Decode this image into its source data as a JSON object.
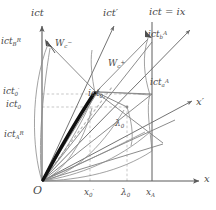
{
  "figure": {
    "kind": "minkowski-spacetime-diagram",
    "background": "#ffffff",
    "line_color": "#6b6b6b",
    "axis_color": "#5a5a5a",
    "dash_color": "#9a9a9a",
    "worldline_color": "#111111",
    "width": 216,
    "height": 210
  },
  "axes": {
    "vertical_label": "ict",
    "vertical_primed_label": "ict",
    "vertical_primed_prime": "′",
    "horizontal_label": "x",
    "horizontal_primed_label": "x",
    "horizontal_primed_prime": "′",
    "origin_label": "O",
    "lightcone_label": "ict = ix"
  },
  "tick_labels": {
    "x_axis": [
      {
        "name": "x0-prime",
        "base": "x",
        "sub": "0",
        "prime": "′",
        "x": 84,
        "y": 189
      },
      {
        "name": "lambda0",
        "base": "λ",
        "sub": "0",
        "prime": "",
        "x": 123,
        "y": 189
      },
      {
        "name": "xA",
        "base": "x",
        "sub": "A",
        "prime": "",
        "x": 149,
        "y": 189
      }
    ],
    "t_axis": [
      {
        "name": "ict0-prime",
        "base": "ict",
        "sub": "0",
        "prime": "′",
        "x": 4,
        "y": 88
      },
      {
        "name": "ict0",
        "base": "ict",
        "sub": "0",
        "prime": "",
        "x": 7,
        "y": 101
      }
    ]
  },
  "annotations": [
    {
      "name": "ict-B-R",
      "base": "ict",
      "sub": "B",
      "sup": "R",
      "prime": "",
      "x": 2,
      "y": 38
    },
    {
      "name": "ict-A-R",
      "base": "ict",
      "sub": "A",
      "sup": "R",
      "prime": "",
      "x": 5,
      "y": 131
    },
    {
      "name": "Wc-minus",
      "base": "W",
      "sub": "c",
      "sup": "−",
      "prime": "",
      "x": 55,
      "y": 40
    },
    {
      "name": "Wc-plus",
      "base": "W",
      "sub": "c",
      "sup": "+",
      "prime": "",
      "x": 108,
      "y": 60
    },
    {
      "name": "ict-b-A",
      "base": "ict",
      "sub": "b",
      "sup": "A",
      "prime": "",
      "x": 148,
      "y": 31
    },
    {
      "name": "ict-a-A",
      "base": "ict",
      "sub": "a",
      "sup": "A",
      "prime": "",
      "x": 150,
      "y": 79
    },
    {
      "name": "ict0-event",
      "base": "ict",
      "sub": "0",
      "sup": "",
      "prime": "",
      "x": 88,
      "y": 90
    },
    {
      "name": "lambda0-inner",
      "base": "λ",
      "sub": "0",
      "sup": "",
      "prime": "",
      "x": 115,
      "y": 120
    },
    {
      "name": "ict-prime-axis",
      "base": "ict",
      "sub": "",
      "sup": "",
      "prime": "′",
      "x": 103,
      "y": 9
    },
    {
      "name": "ict-axis",
      "base": "ict",
      "sub": "",
      "sup": "",
      "prime": "",
      "x": 31,
      "y": 9
    },
    {
      "name": "lightcone",
      "base": "ict = ix",
      "sub": "",
      "sup": "",
      "prime": "",
      "x": 149,
      "y": 8
    },
    {
      "name": "x-prime-axis",
      "base": "x",
      "sub": "",
      "sup": "",
      "prime": "′",
      "x": 196,
      "y": 98
    },
    {
      "name": "x-axis",
      "base": "x",
      "sub": "",
      "sup": "",
      "prime": "",
      "x": 203,
      "y": 176
    },
    {
      "name": "origin",
      "base": "O",
      "sub": "",
      "sup": "",
      "prime": "",
      "x": 34,
      "y": 186
    }
  ],
  "geometry": {
    "origin": {
      "x": 42,
      "y": 181
    },
    "t_axis_top": {
      "x": 42,
      "y": 22
    },
    "x_axis_right": {
      "x": 205,
      "y": 181
    },
    "x_A": 152,
    "x_0_prime": 90,
    "lambda_0": 127,
    "ict_0_prime_y": 94,
    "ict_0_y": 107
  }
}
